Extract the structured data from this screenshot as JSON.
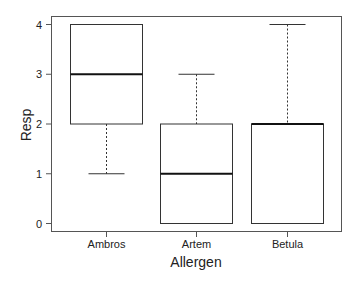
{
  "chart_data": {
    "type": "boxplot",
    "title": "",
    "xlabel": "Allergen",
    "ylabel": "Resp",
    "ylim": [
      0,
      4
    ],
    "yticks": [
      0,
      1,
      2,
      3,
      4
    ],
    "grid": false,
    "legend": null,
    "categories": [
      "Ambros",
      "Artem",
      "Betula"
    ],
    "boxes": [
      {
        "category": "Ambros",
        "min": 1,
        "q1": 2,
        "median": 3,
        "q3": 4,
        "max": 4
      },
      {
        "category": "Artem",
        "min": 0,
        "q1": 0,
        "median": 1,
        "q3": 2,
        "max": 3
      },
      {
        "category": "Betula",
        "min": 0,
        "q1": 0,
        "median": 2,
        "q3": 2,
        "max": 4
      }
    ]
  },
  "colors": {
    "frame": "#555555",
    "box_stroke": "#333333",
    "median": "#111111",
    "text": "#222222",
    "background": "#ffffff"
  }
}
